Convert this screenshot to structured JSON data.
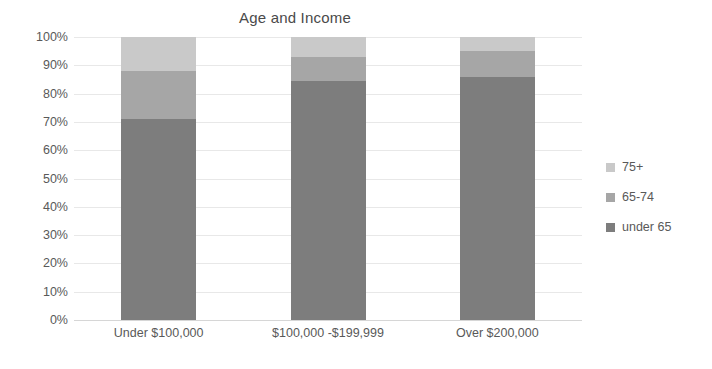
{
  "chart_data": {
    "type": "bar",
    "subtype": "stacked-percent-column",
    "title": "Age and Income",
    "subtitle": "",
    "xlabel": "",
    "ylabel": "",
    "categories": [
      "Under $100,000",
      "$100,000 -$199,999",
      "Over $200,000"
    ],
    "series": [
      {
        "name": "under 65",
        "values": [
          71,
          84.5,
          86
        ],
        "color": "#7d7d7d"
      },
      {
        "name": "65-74",
        "values": [
          17,
          8.5,
          9
        ],
        "color": "#a6a6a6"
      },
      {
        "name": "75+",
        "values": [
          12,
          7,
          5
        ],
        "color": "#c9c9c9"
      }
    ],
    "stack_order_bottom_to_top": [
      "under 65",
      "65-74",
      "75+"
    ],
    "ylim": [
      0,
      100
    ],
    "y_tick_values": [
      0,
      10,
      20,
      30,
      40,
      50,
      60,
      70,
      80,
      90,
      100
    ],
    "y_tick_labels": [
      "0%",
      "10%",
      "20%",
      "30%",
      "40%",
      "50%",
      "60%",
      "70%",
      "80%",
      "90%",
      "100%"
    ],
    "grid": true,
    "grid_axis": "y",
    "legend": true,
    "legend_position": "right",
    "legend_order_top_to_bottom": [
      "75+",
      "65-74",
      "under 65"
    ],
    "value_unit": "percent"
  },
  "title": {
    "text": "Age and Income"
  },
  "axes": {
    "y": {
      "ticks": [
        {
          "label": "100%",
          "value": 100
        },
        {
          "label": "90%",
          "value": 90
        },
        {
          "label": "80%",
          "value": 80
        },
        {
          "label": "70%",
          "value": 70
        },
        {
          "label": "60%",
          "value": 60
        },
        {
          "label": "50%",
          "value": 50
        },
        {
          "label": "40%",
          "value": 40
        },
        {
          "label": "30%",
          "value": 30
        },
        {
          "label": "20%",
          "value": 20
        },
        {
          "label": "10%",
          "value": 10
        },
        {
          "label": "0%",
          "value": 0
        }
      ]
    },
    "x": {
      "ticks": [
        {
          "label": "Under $100,000"
        },
        {
          "label": "$100,000 -$199,999"
        },
        {
          "label": "Over $200,000"
        }
      ]
    }
  },
  "legend": {
    "items": [
      {
        "label": "75+",
        "color": "#c9c9c9"
      },
      {
        "label": "65-74",
        "color": "#a6a6a6"
      },
      {
        "label": "under 65",
        "color": "#7d7d7d"
      }
    ]
  },
  "colors": {
    "background": "#ffffff",
    "text": "#595959",
    "title": "#4a4a4a",
    "gridline": "#e8e8e8",
    "axisline": "#d6d6d6"
  }
}
